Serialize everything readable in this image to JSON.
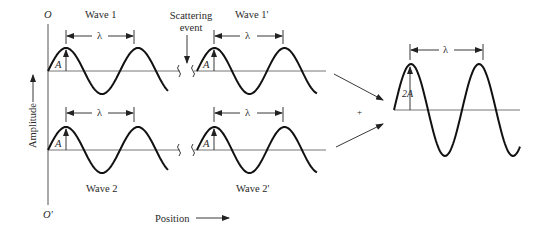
{
  "diagram": {
    "origin_top_label": "O",
    "origin_bottom_label": "O'",
    "y_axis_label": "Amplitude",
    "x_axis_label": "Position",
    "scattering_label_line1": "Scattering",
    "scattering_label_line2": "event",
    "plus_sign": "+",
    "waves": [
      {
        "id": "wave1",
        "title": "Wave 1",
        "amplitude_label": "A",
        "wavelength_label": "λ"
      },
      {
        "id": "wave1p",
        "title": "Wave 1'",
        "amplitude_label": "A",
        "wavelength_label": "λ"
      },
      {
        "id": "wave2",
        "title": "Wave 2",
        "amplitude_label": "A",
        "wavelength_label": "λ"
      },
      {
        "id": "wave2p",
        "title": "Wave 2'",
        "amplitude_label": "A",
        "wavelength_label": "λ"
      },
      {
        "id": "combined",
        "title": "",
        "amplitude_label": "2A",
        "wavelength_label": "λ"
      }
    ]
  },
  "colors": {
    "curve": "#111111",
    "axis": "#555555",
    "text": "#2a2a2a",
    "background": "#ffffff"
  }
}
